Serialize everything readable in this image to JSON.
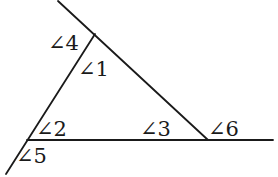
{
  "diagram": {
    "type": "triangle-with-extended-sides",
    "stroke_color": "#1a1a1a",
    "background": "#ffffff",
    "vertices": {
      "top": [
        95,
        34
      ],
      "bottom_left": [
        27,
        140
      ],
      "bottom_right": [
        208,
        140
      ]
    },
    "lines": [
      {
        "name": "right-side-extended",
        "from": [
          58,
          1
        ],
        "to": [
          208,
          140
        ]
      },
      {
        "name": "left-side-extended",
        "from": [
          95,
          34
        ],
        "to": [
          6,
          174
        ]
      },
      {
        "name": "base-extended",
        "from": [
          27,
          140
        ],
        "to": [
          273,
          140
        ]
      }
    ],
    "labels": [
      {
        "id": "angle4",
        "text": "∠4",
        "x": 48,
        "y": 50
      },
      {
        "id": "angle1",
        "text": "∠1",
        "x": 78,
        "y": 76
      },
      {
        "id": "angle2",
        "text": "∠2",
        "x": 36,
        "y": 136
      },
      {
        "id": "angle3",
        "text": "∠3",
        "x": 140,
        "y": 136
      },
      {
        "id": "angle6",
        "text": "∠6",
        "x": 208,
        "y": 136
      },
      {
        "id": "angle5",
        "text": "∠5",
        "x": 16,
        "y": 163
      }
    ]
  }
}
